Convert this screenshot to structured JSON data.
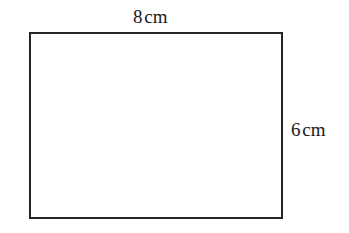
{
  "figure": {
    "type": "geometry-diagram",
    "shape": "rectangle",
    "background_color": "#ffffff",
    "stroke_color": "#262626",
    "stroke_width_px": 2,
    "fill_color": "#ffffff",
    "rect_bounds_px": {
      "x": 29,
      "y": 32,
      "width": 254,
      "height": 187
    },
    "labels": {
      "top": {
        "value": "8",
        "unit": "cm",
        "full_text": "8cm",
        "side": "top",
        "position_px": {
          "x": 133,
          "y": 7
        }
      },
      "right": {
        "value": "6",
        "unit": "cm",
        "full_text": "6cm",
        "side": "right",
        "position_px": {
          "x": 291,
          "y": 120
        }
      }
    }
  }
}
